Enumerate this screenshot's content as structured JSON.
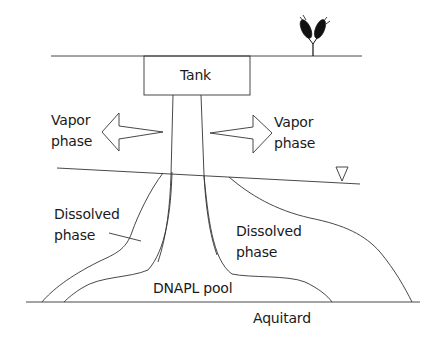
{
  "diagram": {
    "type": "DNAPL contamination cross-section",
    "labels": {
      "tank": "Tank",
      "vapor_left": [
        "Vapor",
        "phase"
      ],
      "vapor_right": [
        "Vapor",
        "phase"
      ],
      "dissolved_left": [
        "Dissolved",
        "phase"
      ],
      "dissolved_right": [
        "Dissolved",
        "phase"
      ],
      "dnapl_pool": "DNAPL pool",
      "aquitard": "Aquitard"
    },
    "symbols": {
      "water_table": "water-table-triangle",
      "vegetation": "plant-icon"
    },
    "colors": {
      "line": "#333333",
      "text": "#1a1a1a",
      "background": "#ffffff"
    }
  }
}
